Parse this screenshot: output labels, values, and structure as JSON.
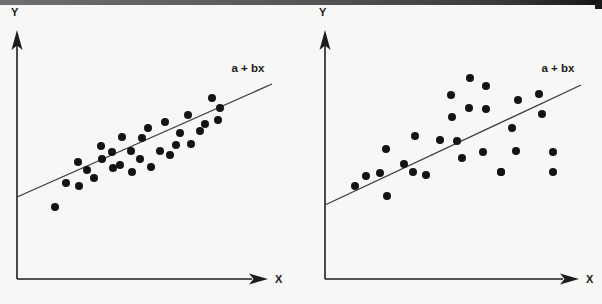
{
  "page": {
    "background_color": "#f7f7f5",
    "scan_artifact_color": "#3c3c3c"
  },
  "figures": [
    {
      "id": "left",
      "name": "scatter-strong-fit",
      "y_axis_label": "Y",
      "x_axis_label": "X",
      "line_label": "a + bx",
      "point_color": "#141414",
      "line_color": "#3a3a3a",
      "axis_color": "#1d1d1d"
    },
    {
      "id": "right",
      "name": "scatter-weak-fit",
      "y_axis_label": "Y",
      "x_axis_label": "X",
      "line_label": "a + bx",
      "point_color": "#141414",
      "line_color": "#3a3a3a",
      "axis_color": "#1d1d1d"
    }
  ],
  "chart_data": [
    {
      "type": "scatter",
      "title": "",
      "subtitle": "",
      "xlabel": "X",
      "ylabel": "Y",
      "xlim": [
        0,
        301
      ],
      "ylim": [
        0,
        304
      ],
      "grid": false,
      "legend": "none",
      "annotations": [
        {
          "text": "a + bx",
          "x": 248,
          "y": 72
        }
      ],
      "series": [
        {
          "name": "observations",
          "marker": "filled-circle",
          "marker_radius": 4.0,
          "color": "#141414",
          "points": [
            [
              55,
              207
            ],
            [
              66,
              183
            ],
            [
              79,
              186
            ],
            [
              87,
              170
            ],
            [
              78,
              162
            ],
            [
              94,
              178
            ],
            [
              102,
              159
            ],
            [
              101,
              146
            ],
            [
              112,
              152
            ],
            [
              113,
              168
            ],
            [
              120,
              165
            ],
            [
              122,
              137
            ],
            [
              131,
              151
            ],
            [
              132,
              172
            ],
            [
              140,
              159
            ],
            [
              142,
              138
            ],
            [
              148,
              128
            ],
            [
              151,
              167
            ],
            [
              160,
              151
            ],
            [
              165,
              122
            ],
            [
              170,
              155
            ],
            [
              176,
              145
            ],
            [
              180,
              133
            ],
            [
              188,
              115
            ],
            [
              191,
              144
            ],
            [
              200,
              131
            ],
            [
              205,
              124
            ],
            [
              212,
              98
            ],
            [
              218,
              120
            ],
            [
              220,
              108
            ]
          ]
        }
      ],
      "fit_line": {
        "name": "a + bx",
        "label": "a + bx",
        "color": "#3a3a3a",
        "x0": 17,
        "y0": 197,
        "x1": 272,
        "y1": 84,
        "slope_sign": "positive",
        "fit_quality": "tight-scatter-high-correlation"
      },
      "axes": {
        "y_axis": {
          "x": 17,
          "y_bottom": 279,
          "y_top": 34,
          "arrow": "up"
        },
        "x_axis": {
          "y": 279,
          "x_left": 17,
          "x_right": 262,
          "arrow": "right"
        }
      }
    },
    {
      "type": "scatter",
      "title": "",
      "subtitle": "",
      "xlabel": "X",
      "ylabel": "Y",
      "xlim": [
        0,
        301
      ],
      "ylim": [
        0,
        304
      ],
      "grid": false,
      "legend": "none",
      "annotations": [
        {
          "text": "a + bx",
          "x": 257,
          "y": 72
        }
      ],
      "series": [
        {
          "name": "observations",
          "marker": "filled-circle",
          "marker_radius": 4.0,
          "color": "#141414",
          "points": [
            [
              54,
              186
            ],
            [
              65,
              176
            ],
            [
              79,
              173
            ],
            [
              86,
              196
            ],
            [
              85,
              149
            ],
            [
              103,
              164
            ],
            [
              112,
              172
            ],
            [
              114,
              136
            ],
            [
              125,
              175
            ],
            [
              139,
              140
            ],
            [
              150,
              95
            ],
            [
              151,
              117
            ],
            [
              156,
              141
            ],
            [
              161,
              158
            ],
            [
              169,
              78
            ],
            [
              168,
              108
            ],
            [
              182,
              152
            ],
            [
              185,
              86
            ],
            [
              185,
              109
            ],
            [
              200,
              172
            ],
            [
              211,
              128
            ],
            [
              215,
              151
            ],
            [
              217,
              100
            ],
            [
              200,
              172
            ],
            [
              241,
              114
            ],
            [
              238,
              94
            ],
            [
              252,
              152
            ],
            [
              252,
              172
            ]
          ]
        }
      ],
      "fit_line": {
        "name": "a + bx",
        "label": "a + bx",
        "color": "#3a3a3a",
        "x0": 24,
        "y0": 205,
        "x1": 280,
        "y1": 85,
        "slope_sign": "positive",
        "fit_quality": "wide-scatter-low-correlation"
      },
      "axes": {
        "y_axis": {
          "x": 24,
          "y_bottom": 279,
          "y_top": 34,
          "arrow": "up"
        },
        "x_axis": {
          "y": 279,
          "x_left": 24,
          "x_right": 272,
          "arrow": "right"
        }
      }
    }
  ]
}
